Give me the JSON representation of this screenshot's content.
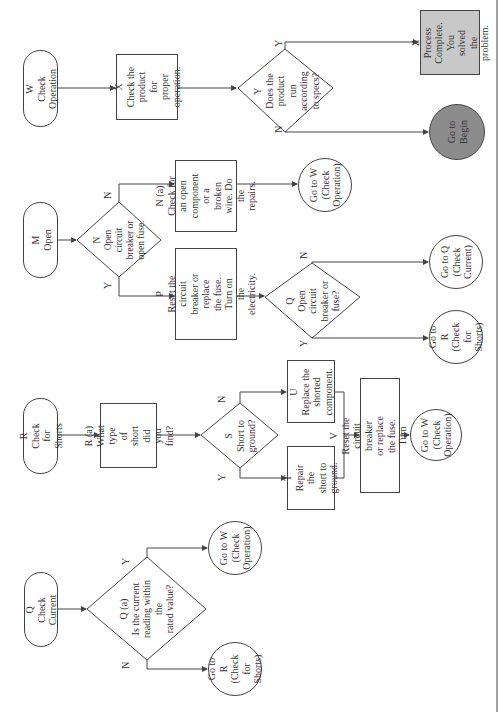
{
  "diagram": {
    "orientation": "rotated-90-ccw",
    "colors": {
      "line": "#444444",
      "z_fill": "#c8c8c8",
      "begin_fill": "#8c8c8c",
      "background": "#ffffff"
    },
    "nodes": {
      "W": {
        "type": "terminal",
        "text": "W\nCheck Operation"
      },
      "X": {
        "type": "process",
        "text": "X\nCheck the\nproduct for\nproper\noperation."
      },
      "Y": {
        "type": "decision",
        "text": "Y\nDoes the\nproduct\nrun according\nto specs?"
      },
      "Z": {
        "type": "process",
        "text": "Z\nProcess\nComplete.\nYou solved\nthe problem."
      },
      "BEGIN": {
        "type": "connector",
        "text": "Go to\nBegin"
      },
      "M": {
        "type": "terminal",
        "text": "M\nOpen"
      },
      "N": {
        "type": "decision",
        "text": "N\nOpen circuit\nbreaker or\nopen fuse."
      },
      "Na": {
        "type": "process",
        "text": "N (a)\nCheck for an open\ncomponent or a\nbroken wire. Do the\nrepairs."
      },
      "GW1": {
        "type": "connector",
        "text": "Go to W\n(Check\nOperation)"
      },
      "P": {
        "type": "process",
        "text": "P\nReset the circuit\nbreaker or replace\nthe fuse. Turn on\nthe electricity."
      },
      "Q2": {
        "type": "decision",
        "text": "Q\nOpen circuit\nbreaker or\nfuse?"
      },
      "GQ": {
        "type": "connector",
        "text": "Go to Q\n(Check\nCurrent)"
      },
      "GR1": {
        "type": "connector",
        "text": "Go to R\n(Check for\nShorts)"
      },
      "R": {
        "type": "terminal",
        "text": "R\nCheck for Shorts"
      },
      "Ra": {
        "type": "process",
        "text": "R (a)\nWhat type of\nshort did you\nfind?"
      },
      "S": {
        "type": "decision",
        "text": "S\nShort to\nground?"
      },
      "U": {
        "type": "process",
        "text": "U\nReplace the\nshorted\ncomponent."
      },
      "T": {
        "type": "process",
        "text": "T\nRepair the\nshort to\nground."
      },
      "V": {
        "type": "process",
        "text": "V\nReset the circuit breaker\nor replace the fuse. Turn\non the electricity."
      },
      "GW2": {
        "type": "connector",
        "text": "Go to W\n(Check\nOperation)"
      },
      "Q": {
        "type": "terminal",
        "text": "Q\nCheck Current"
      },
      "Qa": {
        "type": "decision",
        "text": "Q (a)\nIs the current\nreading within the\nrated value?"
      },
      "GW3": {
        "type": "connector",
        "text": "Go to W\n(Check\nOperation)"
      },
      "GR2": {
        "type": "connector",
        "text": "Go to R\n(Check for\nShorts)"
      }
    },
    "edge_labels": {
      "yes": "Y",
      "no": "N"
    },
    "edges": [
      [
        "W",
        "X"
      ],
      [
        "X",
        "Y"
      ],
      [
        "Y",
        "Z",
        "Y"
      ],
      [
        "Y",
        "BEGIN",
        "N"
      ],
      [
        "M",
        "N"
      ],
      [
        "N",
        "Na",
        "N"
      ],
      [
        "N",
        "P",
        "Y"
      ],
      [
        "Na",
        "GW1"
      ],
      [
        "P",
        "Q2"
      ],
      [
        "Q2",
        "GQ",
        "N"
      ],
      [
        "Q2",
        "GR1",
        "Y"
      ],
      [
        "R",
        "Ra"
      ],
      [
        "Ra",
        "S"
      ],
      [
        "S",
        "U",
        "N"
      ],
      [
        "S",
        "T",
        "Y"
      ],
      [
        "U",
        "V"
      ],
      [
        "T",
        "V"
      ],
      [
        "V",
        "GW2"
      ],
      [
        "Q",
        "Qa"
      ],
      [
        "Qa",
        "GW3",
        "Y"
      ],
      [
        "Qa",
        "GR2",
        "N"
      ]
    ]
  }
}
